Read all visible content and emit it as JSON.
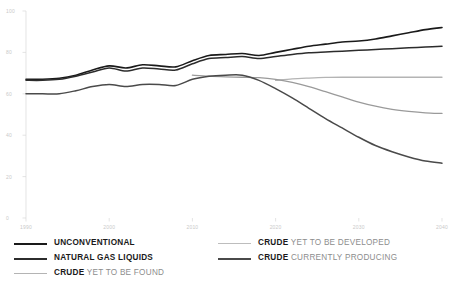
{
  "chart_data": {
    "type": "line",
    "title": "",
    "subtitle": "",
    "xlabel": "",
    "ylabel": "",
    "xlim": [
      1990,
      2040
    ],
    "ylim": [
      0,
      100
    ],
    "grid": false,
    "legend_position": "bottom",
    "xticks": [
      "1990",
      "2000",
      "2010",
      "2020",
      "2030",
      "2040"
    ],
    "xtick_values": [
      1990,
      2000,
      2010,
      2020,
      2030,
      2040
    ],
    "yticks": [
      "100",
      "80",
      "60",
      "40",
      "20",
      "0"
    ],
    "ytick_values": [
      100,
      80,
      60,
      40,
      20,
      0
    ],
    "x": [
      1990,
      1992,
      1994,
      1996,
      1998,
      2000,
      2002,
      2004,
      2006,
      2008,
      2010,
      2012,
      2014,
      2016,
      2018,
      2020,
      2022,
      2024,
      2026,
      2028,
      2030,
      2032,
      2034,
      2036,
      2038,
      2040
    ],
    "series": [
      {
        "name": "UNCONVENTIONAL",
        "color": "#1a1a1a",
        "width": 1.6,
        "values": [
          67,
          67,
          67.5,
          69,
          71.5,
          73.5,
          72.5,
          74,
          73.5,
          73,
          76,
          78.5,
          79,
          79.5,
          78.5,
          80,
          81.5,
          83,
          84,
          85,
          85.5,
          86.5,
          88,
          89.5,
          91,
          92
        ]
      },
      {
        "name": "NATURAL GAS LIQUIDS",
        "color": "#2c2c2c",
        "width": 1.5,
        "values": [
          66.5,
          66.5,
          67,
          68.5,
          70.5,
          72.5,
          71,
          72.5,
          72,
          71.5,
          74.5,
          77,
          77.5,
          78,
          77,
          78,
          79,
          79.8,
          80.2,
          80.6,
          81,
          81.4,
          81.8,
          82.2,
          82.6,
          83
        ]
      },
      {
        "name": "CRUDE YET TO BE FOUND",
        "color": "#b4b4b4",
        "width": 1.3,
        "values": [
          null,
          null,
          null,
          null,
          null,
          null,
          null,
          null,
          null,
          null,
          null,
          null,
          null,
          null,
          null,
          66.5,
          67.2,
          67.6,
          67.9,
          68,
          68,
          68,
          68,
          68,
          68,
          68
        ]
      },
      {
        "name": "CRUDE YET TO BE DEVELOPED",
        "color": "#9a9a9a",
        "width": 1.3,
        "values": [
          null,
          null,
          null,
          null,
          null,
          null,
          null,
          null,
          null,
          null,
          69,
          68.5,
          68.2,
          68,
          67.8,
          67,
          65.5,
          63.5,
          61,
          58.5,
          56,
          54,
          52.5,
          51.5,
          50.8,
          50.5
        ]
      },
      {
        "name": "CRUDE CURRENTLY PRODUCING",
        "color": "#4a4a4a",
        "width": 1.5,
        "values": [
          60,
          60,
          60,
          61.5,
          63.5,
          64.5,
          63.5,
          64.5,
          64.5,
          64,
          67,
          68.5,
          69,
          69,
          66.5,
          62.5,
          58,
          53,
          48,
          43.5,
          39,
          35,
          32,
          29.5,
          27.5,
          26.5
        ]
      }
    ]
  },
  "legend": {
    "left": [
      {
        "bold": "UNCONVENTIONAL",
        "plain": "",
        "color": "#1a1a1a",
        "width": 2.2
      },
      {
        "bold": "NATURAL GAS LIQUIDS",
        "plain": "",
        "color": "#2c2c2c",
        "width": 2.0
      },
      {
        "bold": "CRUDE",
        "plain": " YET TO BE FOUND",
        "color": "#b4b4b4",
        "width": 1.6
      }
    ],
    "right": [
      {
        "bold": "CRUDE",
        "plain": " YET TO BE DEVELOPED",
        "color": "#bdbdbd",
        "width": 1.6
      },
      {
        "bold": "CRUDE",
        "plain": " CURRENTLY PRODUCING",
        "color": "#4a4a4a",
        "width": 2.0
      }
    ]
  }
}
